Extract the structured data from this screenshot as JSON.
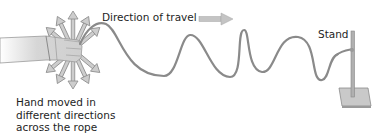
{
  "diagram": {
    "labels": {
      "direction": "Direction of travel",
      "stand": "Stand",
      "hand_line1": "Hand moved in",
      "hand_line2": "different directions",
      "hand_line3": "across the rope"
    },
    "elements": [
      "hand",
      "multi-direction-arrows",
      "rope-wave",
      "direction-arrow",
      "stand"
    ],
    "colors": {
      "rope": "#8a8a8a",
      "arrow_fill": "#c8c8c8",
      "arrow_stroke": "#8c8c8c",
      "skin": "#d9d9d9",
      "stand": "#a8a8a8",
      "text": "#1e1e1e"
    }
  }
}
